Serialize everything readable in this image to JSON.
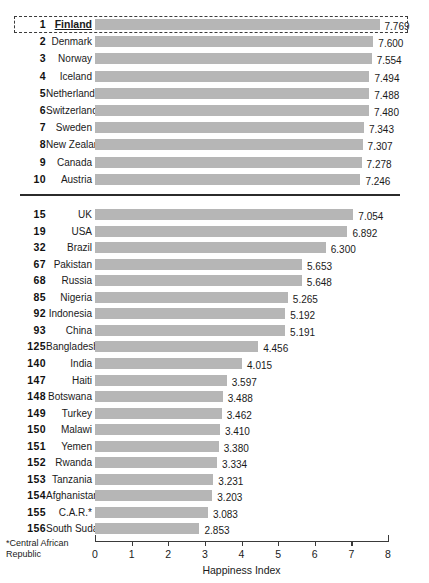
{
  "chart_data": {
    "type": "bar",
    "orientation": "horizontal",
    "title": "",
    "xlabel": "Happiness Index",
    "ylabel": "",
    "xlim": [
      0,
      8
    ],
    "xticks": [
      "0",
      "1",
      "2",
      "3",
      "4",
      "5",
      "6",
      "7",
      "8"
    ],
    "grid": false,
    "legend": null,
    "bar_color": "#b6b6b6",
    "highlight_rank": "1",
    "footnote": "*Central African Republic",
    "groups": [
      {
        "name": "top-ten",
        "rows": [
          {
            "rank": "1",
            "country": "Finland",
            "value": 7.769,
            "label": "7.769",
            "highlight": true
          },
          {
            "rank": "2",
            "country": "Denmark",
            "value": 7.6,
            "label": "7.600",
            "highlight": false
          },
          {
            "rank": "3",
            "country": "Norway",
            "value": 7.554,
            "label": "7.554",
            "highlight": false
          },
          {
            "rank": "4",
            "country": "Iceland",
            "value": 7.494,
            "label": "7.494",
            "highlight": false
          },
          {
            "rank": "5",
            "country": "Netherlands",
            "value": 7.488,
            "label": "7.488",
            "highlight": false
          },
          {
            "rank": "6",
            "country": "Switzerland",
            "value": 7.48,
            "label": "7.480",
            "highlight": false
          },
          {
            "rank": "7",
            "country": "Sweden",
            "value": 7.343,
            "label": "7.343",
            "highlight": false
          },
          {
            "rank": "8",
            "country": "New Zealand",
            "value": 7.307,
            "label": "7.307",
            "highlight": false
          },
          {
            "rank": "9",
            "country": "Canada",
            "value": 7.278,
            "label": "7.278",
            "highlight": false
          },
          {
            "rank": "10",
            "country": "Austria",
            "value": 7.246,
            "label": "7.246",
            "highlight": false
          }
        ]
      },
      {
        "name": "selected-others",
        "rows": [
          {
            "rank": "15",
            "country": "UK",
            "value": 7.054,
            "label": "7.054",
            "highlight": false
          },
          {
            "rank": "19",
            "country": "USA",
            "value": 6.892,
            "label": "6.892",
            "highlight": false
          },
          {
            "rank": "32",
            "country": "Brazil",
            "value": 6.3,
            "label": "6.300",
            "highlight": false
          },
          {
            "rank": "67",
            "country": "Pakistan",
            "value": 5.653,
            "label": "5.653",
            "highlight": false
          },
          {
            "rank": "68",
            "country": "Russia",
            "value": 5.648,
            "label": "5.648",
            "highlight": false
          },
          {
            "rank": "85",
            "country": "Nigeria",
            "value": 5.265,
            "label": "5.265",
            "highlight": false
          },
          {
            "rank": "92",
            "country": "Indonesia",
            "value": 5.192,
            "label": "5.192",
            "highlight": false
          },
          {
            "rank": "93",
            "country": "China",
            "value": 5.191,
            "label": "5.191",
            "highlight": false
          },
          {
            "rank": "125",
            "country": "Bangladesh",
            "value": 4.456,
            "label": "4.456",
            "highlight": false
          },
          {
            "rank": "140",
            "country": "India",
            "value": 4.015,
            "label": "4.015",
            "highlight": false
          },
          {
            "rank": "147",
            "country": "Haiti",
            "value": 3.597,
            "label": "3.597",
            "highlight": false
          },
          {
            "rank": "148",
            "country": "Botswana",
            "value": 3.488,
            "label": "3.488",
            "highlight": false
          },
          {
            "rank": "149",
            "country": "Turkey",
            "value": 3.462,
            "label": "3.462",
            "highlight": false
          },
          {
            "rank": "150",
            "country": "Malawi",
            "value": 3.41,
            "label": "3.410",
            "highlight": false
          },
          {
            "rank": "151",
            "country": "Yemen",
            "value": 3.38,
            "label": "3.380",
            "highlight": false
          },
          {
            "rank": "152",
            "country": "Rwanda",
            "value": 3.334,
            "label": "3.334",
            "highlight": false
          },
          {
            "rank": "153",
            "country": "Tanzania",
            "value": 3.231,
            "label": "3.231",
            "highlight": false
          },
          {
            "rank": "154",
            "country": "Afghanistan",
            "value": 3.203,
            "label": "3.203",
            "highlight": false
          },
          {
            "rank": "155",
            "country": "C.A.R.*",
            "value": 3.083,
            "label": "3.083",
            "highlight": false
          },
          {
            "rank": "156",
            "country": "South Sudan",
            "value": 2.853,
            "label": "2.853",
            "highlight": false
          }
        ]
      }
    ]
  }
}
